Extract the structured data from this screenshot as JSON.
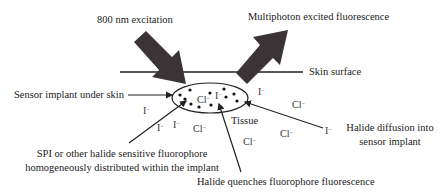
{
  "diagram": {
    "labels": {
      "excitation": "800 nm excitation",
      "fluorescence": "Multiphoton excited fluorescence",
      "skin_surface": "Skin surface",
      "sensor_implant": "Sensor implant under skin",
      "fluorophore_line1": "SPI or other halide sensitive fluorophore",
      "fluorophore_line2": "homogeneously distributed within the implant",
      "tissue": "Tissue",
      "diffusion_line1": "Halide diffusion into",
      "diffusion_line2": "sensor implant",
      "quenching": "Halide quenches fluorophore fluorescence"
    },
    "ions": {
      "iodide_base": "I",
      "chloride_base": "Cl",
      "charge": "−",
      "inside_cl": "Cl",
      "inside_i": "I"
    },
    "colors": {
      "arrow_fill": "#3a3436",
      "line": "#222222",
      "text": "#222222",
      "background": "#ffffff"
    }
  }
}
